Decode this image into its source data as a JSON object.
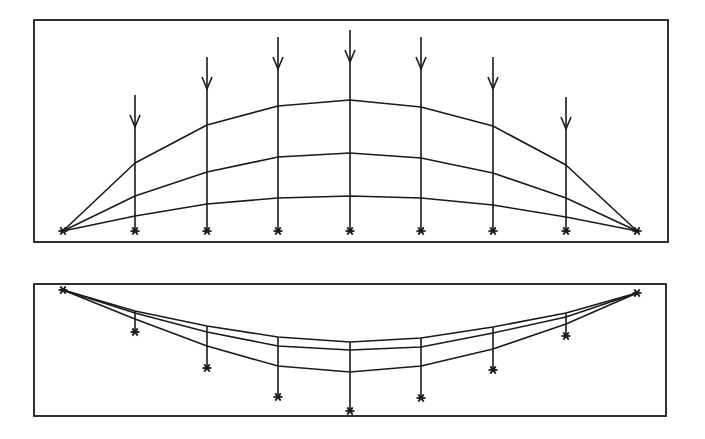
{
  "title": "",
  "colors": {
    "ink": "#1a1a1a",
    "background": "#ffffff"
  },
  "node_x": [
    63,
    135,
    207,
    278,
    350,
    421,
    493,
    566,
    637
  ],
  "top_panel": {
    "frame": {
      "x": 34,
      "y": 20,
      "w": 634,
      "h": 222
    },
    "baseline_y": 231,
    "support_marker": "asterisk",
    "load_arrows": [
      {
        "x": 135,
        "top": 95
      },
      {
        "x": 207,
        "top": 57
      },
      {
        "x": 278,
        "top": 37
      },
      {
        "x": 350,
        "top": 30
      },
      {
        "x": 421,
        "top": 37
      },
      {
        "x": 493,
        "top": 57
      },
      {
        "x": 566,
        "top": 97
      }
    ],
    "curves": [
      {
        "name": "upper",
        "y": [
          231,
          163,
          125,
          106,
          100,
          107,
          126,
          165,
          231
        ]
      },
      {
        "name": "middle",
        "y": [
          231,
          196,
          172,
          157,
          153,
          158,
          173,
          198,
          231
        ]
      },
      {
        "name": "lower",
        "y": [
          231,
          216,
          204,
          198,
          196,
          198,
          205,
          217,
          231
        ]
      }
    ]
  },
  "bottom_panel": {
    "frame": {
      "x": 34,
      "y": 284,
      "w": 632,
      "h": 132
    },
    "support_y": 290,
    "support_marker": "asterisk",
    "hangers": [
      {
        "x": 135,
        "marker_y": 332
      },
      {
        "x": 207,
        "marker_y": 368
      },
      {
        "x": 278,
        "marker_y": 397
      },
      {
        "x": 350,
        "marker_y": 411
      },
      {
        "x": 421,
        "marker_y": 398
      },
      {
        "x": 493,
        "marker_y": 370
      },
      {
        "x": 566,
        "marker_y": 336
      }
    ],
    "curves": [
      {
        "name": "upper",
        "y": [
          290,
          311,
          326,
          337,
          342,
          338,
          327,
          313,
          293
        ]
      },
      {
        "name": "middle",
        "y": [
          290,
          313,
          332,
          346,
          350,
          347,
          333,
          317,
          293
        ]
      },
      {
        "name": "lower",
        "y": [
          290,
          319,
          346,
          366,
          372,
          366,
          349,
          324,
          293
        ]
      }
    ]
  }
}
